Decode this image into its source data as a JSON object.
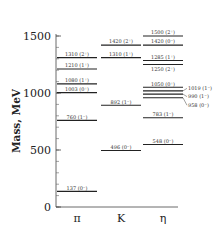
{
  "chart_data": {
    "type": "table",
    "subtype": "energy-level-diagram",
    "title": "",
    "xlabel": "",
    "ylabel": "Mass, MeV",
    "ylim": [
      0,
      1500
    ],
    "yticks": [
      0,
      500,
      1000,
      1500
    ],
    "minor_tick_step": 100,
    "grid": false,
    "categories": [
      "π",
      "K",
      "η"
    ],
    "series": [
      {
        "name": "π",
        "levels": [
          {
            "mass": 137,
            "label": "137 (0⁻)"
          },
          {
            "mass": 760,
            "label": "760 (1⁻)"
          },
          {
            "mass": 1003,
            "label": "1003 (0⁺)"
          },
          {
            "mass": 1080,
            "label": "1080 (1⁺)"
          },
          {
            "mass": 1210,
            "label": "1210 (1⁺)"
          },
          {
            "mass": 1310,
            "label": "1310 (2⁺)"
          }
        ]
      },
      {
        "name": "K",
        "levels": [
          {
            "mass": 496,
            "label": "496 (0⁻)"
          },
          {
            "mass": 892,
            "label": "892 (1⁻)"
          },
          {
            "mass": 1310,
            "label": "1310 (1⁺)"
          },
          {
            "mass": 1420,
            "label": "1420 (2⁺)"
          }
        ]
      },
      {
        "name": "η",
        "levels": [
          {
            "mass": 548,
            "label": "548 (0⁻)"
          },
          {
            "mass": 783,
            "label": "783 (1⁻)"
          },
          {
            "mass": 958,
            "label": "958 (0⁻)",
            "side": true
          },
          {
            "mass": 990,
            "label": "990 (1⁻)",
            "side": true
          },
          {
            "mass": 1019,
            "label": "1019 (1⁻)",
            "side": true
          },
          {
            "mass": 1050,
            "label": "1050 (0⁺)"
          },
          {
            "mass": 1250,
            "label": "1250 (2⁺)",
            "below": true
          },
          {
            "mass": 1285,
            "label": "1285 (1⁺)"
          },
          {
            "mass": 1420,
            "label": "1420 (0⁻)"
          },
          {
            "mass": 1500,
            "label": "1500 (2⁺)"
          }
        ]
      }
    ]
  },
  "axis": {
    "ylabel": "Mass, MeV",
    "ticks": [
      "0",
      "500",
      "1000",
      "1500"
    ],
    "categories": [
      "π",
      "K",
      "η"
    ]
  }
}
